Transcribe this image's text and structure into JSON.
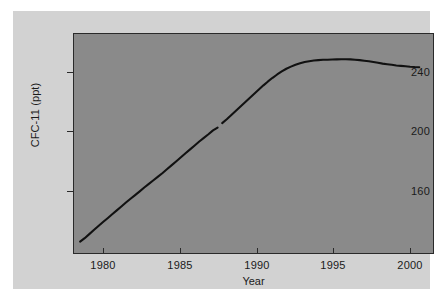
{
  "figure": {
    "background_color": "#d2d2d2",
    "plot_background_color": "#8a8a8a",
    "axis_color": "#2a2a2a",
    "line_color": "#111111"
  },
  "chart_data": {
    "type": "line",
    "title": "",
    "subtitle": "",
    "xlabel": "Year",
    "ylabel": "CFC-11 (ppt)",
    "xlim": [
      1978,
      2001.5
    ],
    "ylim": [
      130,
      275
    ],
    "xticks": [
      1980,
      1985,
      1990,
      1995,
      2000
    ],
    "xtick_labels": [
      "1980",
      "1985",
      "1990",
      "1995",
      "2000"
    ],
    "yticks": [
      160,
      200,
      240
    ],
    "ytick_labels": [
      "160",
      "200",
      "240"
    ],
    "grid": false,
    "legend": null,
    "annotations": [],
    "series": [
      {
        "name": "CFC-11 atmospheric mixing ratio",
        "units": "ppt",
        "note": "small data gap near 1987.4",
        "x": [
          1978.4,
          1978.7,
          1979.0,
          1979.3,
          1979.6,
          1979.9,
          1980.2,
          1980.5,
          1980.8,
          1981.1,
          1981.4,
          1981.7,
          1982.0,
          1982.3,
          1982.6,
          1982.9,
          1983.2,
          1983.5,
          1983.8,
          1984.1,
          1984.4,
          1984.7,
          1985.0,
          1985.3,
          1985.6,
          1985.9,
          1986.2,
          1986.5,
          1986.8,
          1987.1,
          1987.4,
          1987.7,
          1988.0,
          1988.3,
          1988.6,
          1988.9,
          1989.2,
          1989.5,
          1989.8,
          1990.1,
          1990.4,
          1990.7,
          1991.0,
          1991.3,
          1991.6,
          1991.9,
          1992.2,
          1992.5,
          1992.8,
          1993.1,
          1993.4,
          1993.7,
          1994.0,
          1994.3,
          1994.6,
          1994.9,
          1995.2,
          1995.5,
          1995.8,
          1996.1,
          1996.4,
          1996.7,
          1997.0,
          1997.3,
          1997.6,
          1997.9,
          1998.2,
          1998.5,
          1998.8,
          1999.1,
          1999.4,
          1999.7,
          2000.0,
          2000.3,
          2000.6
        ],
        "y": [
          137.5,
          139.8,
          142.5,
          145.2,
          147.9,
          150.5,
          153.0,
          155.6,
          158.2,
          160.8,
          163.4,
          165.9,
          168.3,
          170.8,
          173.4,
          175.8,
          178.2,
          180.6,
          183.0,
          185.6,
          188.2,
          190.8,
          193.4,
          196.0,
          198.6,
          201.2,
          203.8,
          206.2,
          208.6,
          211.2,
          213.0,
          216.0,
          218.6,
          221.4,
          224.2,
          227.0,
          229.8,
          232.6,
          235.4,
          238.2,
          241.0,
          243.6,
          246.0,
          248.2,
          250.2,
          252.0,
          253.4,
          254.6,
          255.6,
          256.4,
          257.0,
          257.4,
          257.7,
          257.9,
          258.0,
          258.1,
          258.2,
          258.3,
          258.3,
          258.2,
          258.0,
          257.7,
          257.3,
          256.9,
          256.4,
          255.9,
          255.4,
          255.0,
          254.6,
          254.2,
          253.9,
          253.6,
          253.3,
          253.1,
          253.0
        ]
      }
    ]
  }
}
